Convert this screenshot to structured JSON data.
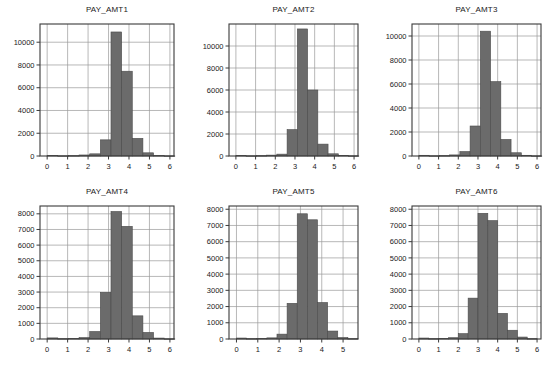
{
  "figure": {
    "name": "pay-amount-histogram-grid",
    "rows": 2,
    "cols": 3,
    "background": "#ffffff",
    "bar_color": "#6b6b6b",
    "bar_edge_color": "#4a4a4a",
    "grid_color": "#9a9a9a",
    "frame_color": "#3a3a3a",
    "text_color": "#1a1a1a"
  },
  "chart_data": [
    {
      "type": "bar",
      "title": "PAY_AMT1",
      "xlabel": "",
      "ylabel": "",
      "xlim": [
        -0.35,
        6.2
      ],
      "ylim": [
        0,
        11600
      ],
      "xticks": [
        0,
        1,
        2,
        3,
        4,
        5,
        6
      ],
      "yticks": [
        0,
        2000,
        4000,
        6000,
        8000,
        10000
      ],
      "xtick_labels": [
        "0",
        "1",
        "2",
        "3",
        "4",
        "5",
        "6"
      ],
      "ytick_labels": [
        "0",
        "2000",
        "4000",
        "6000",
        "8000",
        "10000"
      ],
      "grid": true,
      "bin_edges": [
        0.0,
        0.52,
        1.04,
        1.56,
        2.08,
        2.6,
        3.12,
        3.64,
        4.16,
        4.68,
        5.2,
        5.72,
        6.24
      ],
      "values": [
        60,
        20,
        30,
        90,
        190,
        1420,
        10900,
        7450,
        1550,
        280,
        40,
        15
      ]
    },
    {
      "type": "bar",
      "title": "PAY_AMT2",
      "xlabel": "",
      "ylabel": "",
      "xlim": [
        -0.35,
        6.2
      ],
      "ylim": [
        0,
        12000
      ],
      "xticks": [
        0,
        1,
        2,
        3,
        4,
        5,
        6
      ],
      "yticks": [
        0,
        2000,
        4000,
        6000,
        8000,
        10000
      ],
      "xtick_labels": [
        "0",
        "1",
        "2",
        "3",
        "4",
        "5",
        "6"
      ],
      "ytick_labels": [
        "0",
        "2000",
        "4000",
        "6000",
        "8000",
        "10000"
      ],
      "grid": true,
      "bin_edges": [
        0.0,
        0.52,
        1.04,
        1.56,
        2.08,
        2.6,
        3.12,
        3.64,
        4.16,
        4.68,
        5.2,
        5.72,
        6.24
      ],
      "values": [
        50,
        20,
        30,
        80,
        170,
        2400,
        11550,
        6000,
        1080,
        200,
        60,
        20
      ]
    },
    {
      "type": "bar",
      "title": "PAY_AMT3",
      "xlabel": "",
      "ylabel": "",
      "xlim": [
        -0.35,
        6.2
      ],
      "ylim": [
        0,
        11000
      ],
      "xticks": [
        0,
        1,
        2,
        3,
        4,
        5,
        6
      ],
      "yticks": [
        0,
        2000,
        4000,
        6000,
        8000,
        10000
      ],
      "xtick_labels": [
        "0",
        "1",
        "2",
        "3",
        "4",
        "5",
        "6"
      ],
      "ytick_labels": [
        "0",
        "2000",
        "4000",
        "6000",
        "8000",
        "10000"
      ],
      "grid": true,
      "bin_edges": [
        0.0,
        0.52,
        1.04,
        1.56,
        2.08,
        2.6,
        3.12,
        3.64,
        4.16,
        4.68,
        5.2,
        5.72,
        6.24
      ],
      "values": [
        60,
        20,
        30,
        90,
        370,
        2500,
        10400,
        6200,
        1380,
        270,
        60,
        15
      ]
    },
    {
      "type": "bar",
      "title": "PAY_AMT4",
      "xlabel": "",
      "ylabel": "",
      "xlim": [
        -0.35,
        6.2
      ],
      "ylim": [
        0,
        8500
      ],
      "xticks": [
        0,
        1,
        2,
        3,
        4,
        5,
        6
      ],
      "yticks": [
        0,
        1000,
        2000,
        3000,
        4000,
        5000,
        6000,
        7000,
        8000
      ],
      "xtick_labels": [
        "0",
        "1",
        "2",
        "3",
        "4",
        "5",
        "6"
      ],
      "ytick_labels": [
        "0",
        "1000",
        "2000",
        "3000",
        "4000",
        "5000",
        "6000",
        "7000",
        "8000"
      ],
      "grid": true,
      "bin_edges": [
        0.0,
        0.52,
        1.04,
        1.56,
        2.08,
        2.6,
        3.12,
        3.64,
        4.16,
        4.68,
        5.2,
        5.72,
        6.24
      ],
      "values": [
        70,
        20,
        30,
        90,
        480,
        2980,
        8150,
        7200,
        1480,
        420,
        60,
        15
      ]
    },
    {
      "type": "bar",
      "title": "PAY_AMT5",
      "xlabel": "",
      "ylabel": "",
      "xlim": [
        -0.35,
        5.7
      ],
      "ylim": [
        0,
        8200
      ],
      "xticks": [
        0,
        1,
        2,
        3,
        4,
        5
      ],
      "yticks": [
        0,
        1000,
        2000,
        3000,
        4000,
        5000,
        6000,
        7000,
        8000
      ],
      "xtick_labels": [
        "0",
        "1",
        "2",
        "3",
        "4",
        "5"
      ],
      "ytick_labels": [
        "0",
        "1000",
        "2000",
        "3000",
        "4000",
        "5000",
        "6000",
        "7000",
        "8000"
      ],
      "grid": true,
      "bin_edges": [
        0.0,
        0.475,
        0.95,
        1.425,
        1.9,
        2.375,
        2.85,
        3.325,
        3.8,
        4.275,
        4.75,
        5.225,
        5.7
      ],
      "values": [
        60,
        20,
        30,
        70,
        300,
        2200,
        7720,
        7350,
        2250,
        490,
        90,
        20
      ]
    },
    {
      "type": "bar",
      "title": "PAY_AMT6",
      "xlabel": "",
      "ylabel": "",
      "xlim": [
        -0.35,
        6.2
      ],
      "ylim": [
        0,
        8200
      ],
      "xticks": [
        0,
        1,
        2,
        3,
        4,
        5,
        6
      ],
      "yticks": [
        0,
        1000,
        2000,
        3000,
        4000,
        5000,
        6000,
        7000,
        8000
      ],
      "xtick_labels": [
        "0",
        "1",
        "2",
        "3",
        "4",
        "5",
        "6"
      ],
      "ytick_labels": [
        "0",
        "1000",
        "2000",
        "3000",
        "4000",
        "5000",
        "6000",
        "7000",
        "8000"
      ],
      "grid": true,
      "bin_edges": [
        0.0,
        0.5,
        1.0,
        1.5,
        2.0,
        2.5,
        3.0,
        3.5,
        4.0,
        4.5,
        5.0,
        5.5,
        6.0
      ],
      "values": [
        60,
        20,
        30,
        80,
        330,
        2520,
        7750,
        7300,
        1580,
        540,
        120,
        20
      ]
    }
  ]
}
